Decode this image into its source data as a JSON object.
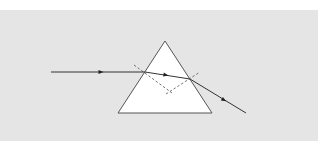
{
  "diagram": {
    "type": "prism-refraction",
    "colors": {
      "page_background": "#ffffff",
      "panel_background": "#e5e5e5",
      "prism_fill": "#ffffff",
      "prism_stroke": "#555555",
      "ray_color": "#333333",
      "normal_color": "#666666"
    },
    "prism": {
      "apex": [
        165,
        41
      ],
      "base_left": [
        118,
        113
      ],
      "base_right": [
        212,
        113
      ]
    },
    "rays": {
      "incident": {
        "from": [
          51,
          72
        ],
        "to": [
          145,
          72
        ],
        "arrow_at": [
          101,
          72
        ]
      },
      "internal": {
        "from": [
          145,
          72
        ],
        "to": [
          190,
          79
        ],
        "arrow_at": [
          166,
          75
        ]
      },
      "emergent": {
        "from": [
          190,
          79
        ],
        "to": [
          246,
          113
        ],
        "arrow_at": [
          224,
          100
        ]
      }
    },
    "normals": {
      "entry": {
        "from": [
          134,
          65
        ],
        "to": [
          172,
          93
        ],
        "style": "dashed"
      },
      "exit": {
        "from": [
          166,
          94
        ],
        "to": [
          200,
          72
        ],
        "style": "dashed"
      }
    }
  }
}
